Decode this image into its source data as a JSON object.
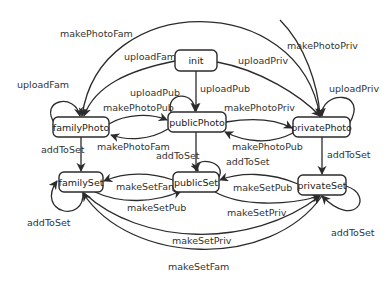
{
  "diagram": {
    "type": "state-machine",
    "nodes": {
      "init": "init",
      "familyPhoto": "familyPhoto",
      "publicPhoto": "publicPhoto",
      "privatePhoto": "privatePhoto",
      "familySet": "familySet",
      "publicSet": "publicSet",
      "privateSet": "privateSet"
    },
    "edges": [
      {
        "id": "e1",
        "from": "init",
        "to": "familyPhoto",
        "label": "uploadFam"
      },
      {
        "id": "e2",
        "from": "init",
        "to": "publicPhoto",
        "label": "uploadPub"
      },
      {
        "id": "e3",
        "from": "init",
        "to": "privatePhoto",
        "label": "uploadPriv"
      },
      {
        "id": "e4",
        "from": "familyPhoto",
        "to": "familyPhoto",
        "label": "uploadFam"
      },
      {
        "id": "e5",
        "from": "publicPhoto",
        "to": "publicPhoto",
        "label": "uploadPub"
      },
      {
        "id": "e6",
        "from": "privatePhoto",
        "to": "privatePhoto",
        "label": "uploadPriv"
      },
      {
        "id": "e7",
        "from": "privatePhoto",
        "to": "familyPhoto",
        "label": "makePhotoFam"
      },
      {
        "id": "e8",
        "from": "familyPhoto",
        "to": "privatePhoto",
        "label": "makePhotoPriv"
      },
      {
        "id": "e9",
        "from": "familyPhoto",
        "to": "publicPhoto",
        "label": "makePhotoPub"
      },
      {
        "id": "e10",
        "from": "publicPhoto",
        "to": "familyPhoto",
        "label": "makePhotoFam"
      },
      {
        "id": "e11",
        "from": "publicPhoto",
        "to": "privatePhoto",
        "label": "makePhotoPriv"
      },
      {
        "id": "e12",
        "from": "privatePhoto",
        "to": "publicPhoto",
        "label": "makePhotoPub"
      },
      {
        "id": "e13",
        "from": "familyPhoto",
        "to": "familySet",
        "label": "addToSet"
      },
      {
        "id": "e14",
        "from": "publicPhoto",
        "to": "publicSet",
        "label": "addToSet"
      },
      {
        "id": "e15",
        "from": "privatePhoto",
        "to": "privateSet",
        "label": "addToSet"
      },
      {
        "id": "e16",
        "from": "familySet",
        "to": "familySet",
        "label": "addToSet"
      },
      {
        "id": "e17",
        "from": "publicSet",
        "to": "publicSet",
        "label": "addToSet"
      },
      {
        "id": "e18",
        "from": "privateSet",
        "to": "privateSet",
        "label": "addToSet"
      },
      {
        "id": "e19",
        "from": "publicSet",
        "to": "familySet",
        "label": "makeSetFam"
      },
      {
        "id": "e20",
        "from": "familySet",
        "to": "publicSet",
        "label": "makeSetPub"
      },
      {
        "id": "e21",
        "from": "privateSet",
        "to": "publicSet",
        "label": "makeSetPub"
      },
      {
        "id": "e22",
        "from": "publicSet",
        "to": "privateSet",
        "label": "makeSetPriv"
      },
      {
        "id": "e23",
        "from": "familySet",
        "to": "privateSet",
        "label": "makeSetPriv"
      },
      {
        "id": "e24",
        "from": "privateSet",
        "to": "familySet",
        "label": "makeSetFam"
      }
    ]
  }
}
